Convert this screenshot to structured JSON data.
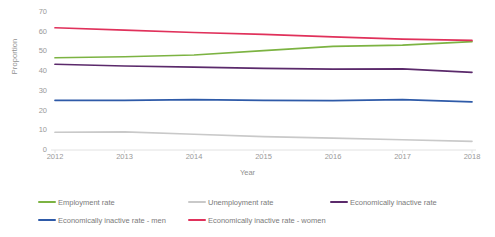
{
  "chart_data": {
    "type": "line",
    "title": "",
    "xlabel": "Year",
    "ylabel": "Proportion",
    "x": [
      2012,
      2013,
      2014,
      2015,
      2016,
      2017,
      2018
    ],
    "categories": [
      "2012",
      "2013",
      "2014",
      "2015",
      "2016",
      "2017",
      "2018"
    ],
    "ylim": [
      0,
      70
    ],
    "yticks": [
      0,
      10,
      20,
      30,
      40,
      50,
      60,
      70
    ],
    "ytick_labels": [
      "0",
      "10",
      "20",
      "30",
      "40",
      "50",
      "60",
      "70"
    ],
    "grid": false,
    "legend_position": "bottom",
    "series": [
      {
        "name": "Employment rate",
        "color": "#7CB342",
        "values": [
          46.8,
          47.3,
          48.2,
          50.4,
          52.6,
          53.2,
          55.0
        ]
      },
      {
        "name": "Unemployment rate",
        "color": "#C9C9C9",
        "values": [
          9.0,
          9.2,
          8.0,
          6.8,
          6.0,
          5.2,
          4.4
        ]
      },
      {
        "name": "Economically inactive rate",
        "color": "#5B2A6B",
        "values": [
          43.5,
          42.6,
          42.0,
          41.4,
          41.0,
          41.2,
          39.4
        ]
      },
      {
        "name": "Economically inactive rate - men",
        "color": "#2E5AA8",
        "values": [
          25.2,
          25.2,
          25.6,
          25.2,
          25.0,
          25.6,
          24.4
        ]
      },
      {
        "name": "Economically inactive rate - women",
        "color": "#E0315B",
        "values": [
          62.0,
          60.8,
          59.6,
          58.6,
          57.4,
          56.2,
          55.6
        ]
      }
    ]
  },
  "legend": {
    "items": [
      {
        "label": "Employment rate"
      },
      {
        "label": "Unemployment rate"
      },
      {
        "label": "Economically inactive rate"
      },
      {
        "label": "Economically inactive rate - men"
      },
      {
        "label": "Economically inactive rate - women"
      }
    ]
  }
}
